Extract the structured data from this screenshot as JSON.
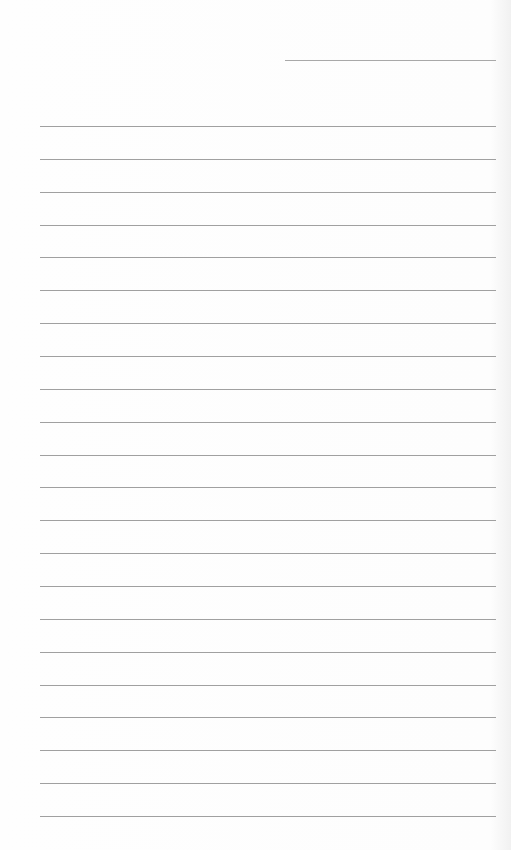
{
  "document": {
    "type": "lined-paper",
    "header_field": {
      "left": 285,
      "top": 60,
      "width": 211
    },
    "rules": {
      "count": 22,
      "first_top": 126,
      "spacing": 32.86,
      "left": 40,
      "width": 456,
      "color": "#a0a0a0"
    }
  }
}
